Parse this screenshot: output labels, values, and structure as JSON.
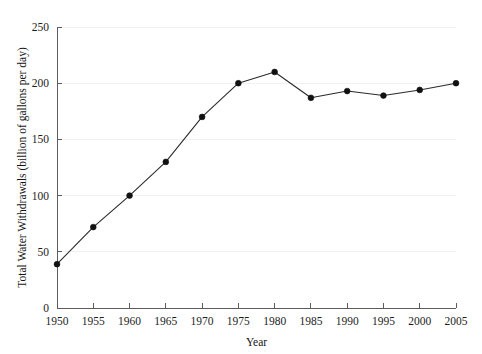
{
  "chart_data": {
    "type": "line",
    "title": "",
    "xlabel": "Year",
    "ylabel": "Total Water Withdrawals (billion of gallons per day)",
    "x": [
      1950,
      1955,
      1960,
      1965,
      1970,
      1975,
      1980,
      1985,
      1990,
      1995,
      2000,
      2005
    ],
    "values": [
      39,
      72,
      100,
      130,
      170,
      200,
      210,
      187,
      193,
      189,
      194,
      200
    ],
    "series": [
      {
        "name": "Total Water Withdrawals",
        "values": [
          39,
          72,
          100,
          130,
          170,
          200,
          210,
          187,
          193,
          189,
          194,
          200
        ]
      }
    ],
    "xticks": [
      1950,
      1955,
      1960,
      1965,
      1970,
      1975,
      1980,
      1985,
      1990,
      1995,
      2000,
      2005
    ],
    "xtick_labels": [
      "1950",
      "1955",
      "1960",
      "1965",
      "1970",
      "1975",
      "1980",
      "1985",
      "1990",
      "1995",
      "2000",
      "2005"
    ],
    "yticks": [
      0,
      50,
      100,
      150,
      200,
      250
    ],
    "ytick_labels": [
      "0",
      "50",
      "100",
      "150",
      "200",
      "250"
    ],
    "xlim": [
      1950,
      2005
    ],
    "ylim": [
      0,
      250
    ],
    "grid": "horizontal",
    "legend": "none",
    "marker": "filled-circle",
    "colors": {
      "line": "#2b2b2b",
      "marker": "#111111",
      "grid": "#f1f1f1",
      "axis": "#5c5c5c",
      "text": "#1c1c1c",
      "background": "#ffffff"
    }
  }
}
